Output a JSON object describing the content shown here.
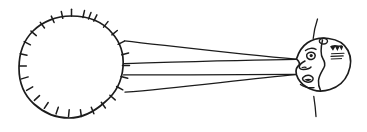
{
  "image": {
    "title": "Radiating source and observing head",
    "background_color": "#ffffff",
    "ink_color": "#1c1c1c",
    "width": 367,
    "height": 132,
    "style": "hand-drawn line art, monochrome, no text labels"
  },
  "scene": {
    "caption": "",
    "elements": [
      {
        "name": "radiant-disc",
        "label": "",
        "description": "Large circle with radial tick marks around its rim, suggesting a sun or radiating source"
      },
      {
        "name": "ray-bundle",
        "label": "",
        "description": "Four straight rays converging from the right edge of the disc to the observer's eye"
      },
      {
        "name": "observer-head",
        "label": "",
        "description": "Head drawn in left-facing profile with eye, nose, mouth and shaded hair at the back"
      },
      {
        "name": "body-axis-line",
        "label": "",
        "description": "Short broken vertical strokes above and below the head indicating a body axis"
      }
    ]
  },
  "radiant_disc": {
    "center_x": 71.5,
    "center_y": 67,
    "radius": 51,
    "tick_count": 28,
    "tick_length": 7,
    "stroke_width": 1.5
  },
  "rays": {
    "count": 4,
    "stroke_width": 1.2,
    "converge_points": [
      {
        "x": 296,
        "y": 59
      },
      {
        "x": 296,
        "y": 74
      }
    ],
    "origins": [
      {
        "x": 124,
        "y": 41
      },
      {
        "x": 124,
        "y": 64
      },
      {
        "x": 124,
        "y": 75
      },
      {
        "x": 124,
        "y": 92
      }
    ]
  },
  "observer_head": {
    "center_x": 322,
    "center_y": 66,
    "width": 58,
    "height": 52,
    "facing": "left",
    "features": [
      "eye",
      "nose",
      "mouth",
      "chin",
      "hair-hatching",
      "ear"
    ],
    "stroke_width": 1.6
  },
  "body_axis": {
    "top_segment": {
      "x1": 316,
      "y1": 19,
      "x2": 313,
      "y2": 38
    },
    "bottom_segment": {
      "x1": 314,
      "y1": 96,
      "x2": 316,
      "y2": 116
    },
    "stroke_width": 1.3
  },
  "chart_data": {
    "type": "diagram",
    "title": "",
    "annotations": []
  }
}
